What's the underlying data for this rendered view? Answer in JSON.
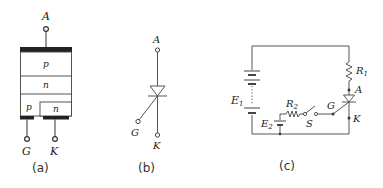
{
  "figure": {
    "panels": [
      {
        "id": "a",
        "caption": "(a)",
        "description": "Thyristor PNPN structure",
        "layers": [
          {
            "label": "p"
          },
          {
            "label": "n"
          },
          {
            "label": "p"
          },
          {
            "label": "n"
          }
        ],
        "terminals": {
          "anode": "A",
          "gate": "G",
          "cathode": "K"
        }
      },
      {
        "id": "b",
        "caption": "(b)",
        "description": "Thyristor circuit symbol",
        "terminals": {
          "anode": "A",
          "gate": "G",
          "cathode": "K"
        }
      },
      {
        "id": "c",
        "caption": "(c)",
        "description": "Thyristor test circuit",
        "components": {
          "battery_main": {
            "name": "E",
            "sub": "1"
          },
          "battery_gate": {
            "name": "E",
            "sub": "2"
          },
          "resistor_load": {
            "name": "R",
            "sub": "1"
          },
          "resistor_gate": {
            "name": "R",
            "sub": "2"
          },
          "switch": "S",
          "anode": "A",
          "gate": "G",
          "cathode": "K"
        }
      }
    ],
    "colors": {
      "line": "#333333",
      "background": "#ffffff"
    }
  }
}
